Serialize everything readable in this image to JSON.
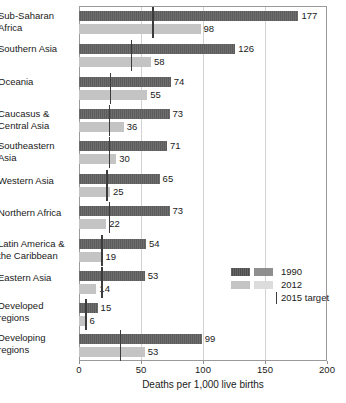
{
  "chart_data": {
    "type": "bar",
    "orientation": "horizontal",
    "title": "",
    "xlabel": "Deaths per 1,000 live births",
    "ylabel": "",
    "xlim": [
      0,
      200
    ],
    "xticks": [
      0,
      50,
      100,
      150,
      200
    ],
    "xtick_labels": [
      "0",
      "50",
      "100",
      "150",
      "200"
    ],
    "grid": "vertical",
    "legend_position": "inside-right",
    "categories": [
      "Sub-Saharan Africa",
      "Southern Asia",
      "Oceania",
      "Caucasus & Central Asia",
      "Southeastern Asia",
      "Western Asia",
      "Northern Africa",
      "Latin America & the Caribbean",
      "Eastern Asia",
      "Developed regions",
      "Developing regions"
    ],
    "series": [
      {
        "name": "1990",
        "color": "#5c5c5c",
        "values": [
          177,
          126,
          74,
          73,
          71,
          65,
          73,
          54,
          53,
          15,
          99
        ]
      },
      {
        "name": "2012",
        "color": "#c4c4c4",
        "values": [
          98,
          58,
          55,
          36,
          30,
          25,
          22,
          19,
          14,
          6,
          53
        ]
      }
    ],
    "markers": {
      "name": "2015 target",
      "color": "#3c3c3c",
      "values": [
        59,
        42,
        25,
        24,
        24,
        22,
        24,
        18,
        18,
        5,
        33
      ]
    }
  },
  "rows": [
    {
      "label_line1": "Sub-Saharan",
      "label_line2": "Africa",
      "v1990": 177,
      "v2012": 98,
      "target": 59,
      "label_1990": "177",
      "label_2012": "98"
    },
    {
      "label_line1": "Southern Asia",
      "label_line2": "",
      "v1990": 126,
      "v2012": 58,
      "target": 42,
      "label_1990": "126",
      "label_2012": "58"
    },
    {
      "label_line1": "Oceania",
      "label_line2": "",
      "v1990": 74,
      "v2012": 55,
      "target": 25,
      "label_1990": "74",
      "label_2012": "55"
    },
    {
      "label_line1": "Caucasus &",
      "label_line2": "Central Asia",
      "v1990": 73,
      "v2012": 36,
      "target": 24,
      "label_1990": "73",
      "label_2012": "36"
    },
    {
      "label_line1": "Southeastern",
      "label_line2": "Asia",
      "v1990": 71,
      "v2012": 30,
      "target": 24,
      "label_1990": "71",
      "label_2012": "30"
    },
    {
      "label_line1": "Western Asia",
      "label_line2": "",
      "v1990": 65,
      "v2012": 25,
      "target": 22,
      "label_1990": "65",
      "label_2012": "25"
    },
    {
      "label_line1": "Northern Africa",
      "label_line2": "",
      "v1990": 73,
      "v2012": 22,
      "target": 24,
      "label_1990": "73",
      "label_2012": "22"
    },
    {
      "label_line1": "Latin America &",
      "label_line2": "the Caribbean",
      "v1990": 54,
      "v2012": 19,
      "target": 18,
      "label_1990": "54",
      "label_2012": "19"
    },
    {
      "label_line1": "Eastern Asia",
      "label_line2": "",
      "v1990": 53,
      "v2012": 14,
      "target": 18,
      "label_1990": "53",
      "label_2012": "14"
    },
    {
      "label_line1": "Developed",
      "label_line2": "regions",
      "v1990": 15,
      "v2012": 6,
      "target": 5,
      "label_1990": "15",
      "label_2012": "6"
    },
    {
      "label_line1": "Developing",
      "label_line2": "regions",
      "v1990": 99,
      "v2012": 53,
      "target": 33,
      "label_1990": "99",
      "label_2012": "53"
    }
  ],
  "axis": {
    "title": "Deaths per 1,000 live births",
    "ticks": [
      "0",
      "50",
      "100",
      "150",
      "200"
    ]
  },
  "legend": {
    "items": [
      {
        "label": "1990"
      },
      {
        "label": "2012"
      },
      {
        "label": "2015 target"
      }
    ]
  },
  "colors": {
    "bar_1990": "#5c5c5c",
    "bar_2012": "#c4c4c4",
    "target_line": "#3c3c3c",
    "gridline": "#d2d2d2",
    "frame": "#9a9a9a"
  }
}
